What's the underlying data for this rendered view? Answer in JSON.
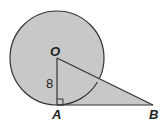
{
  "figure": {
    "points": {
      "O": {
        "label": "O",
        "x": 57,
        "y": 58
      },
      "A": {
        "label": "A",
        "x": 57,
        "y": 105
      },
      "B": {
        "label": "B",
        "x": 153,
        "y": 105
      }
    },
    "circle": {
      "cx": 57,
      "cy": 58,
      "r": 47
    },
    "labels": {
      "O": "O",
      "A": "A",
      "B": "B",
      "radius_length": "8"
    },
    "colors": {
      "fill": "#c8c8c8",
      "stroke": "#333333",
      "background": "#ffffff"
    },
    "right_angle_at": "A"
  }
}
